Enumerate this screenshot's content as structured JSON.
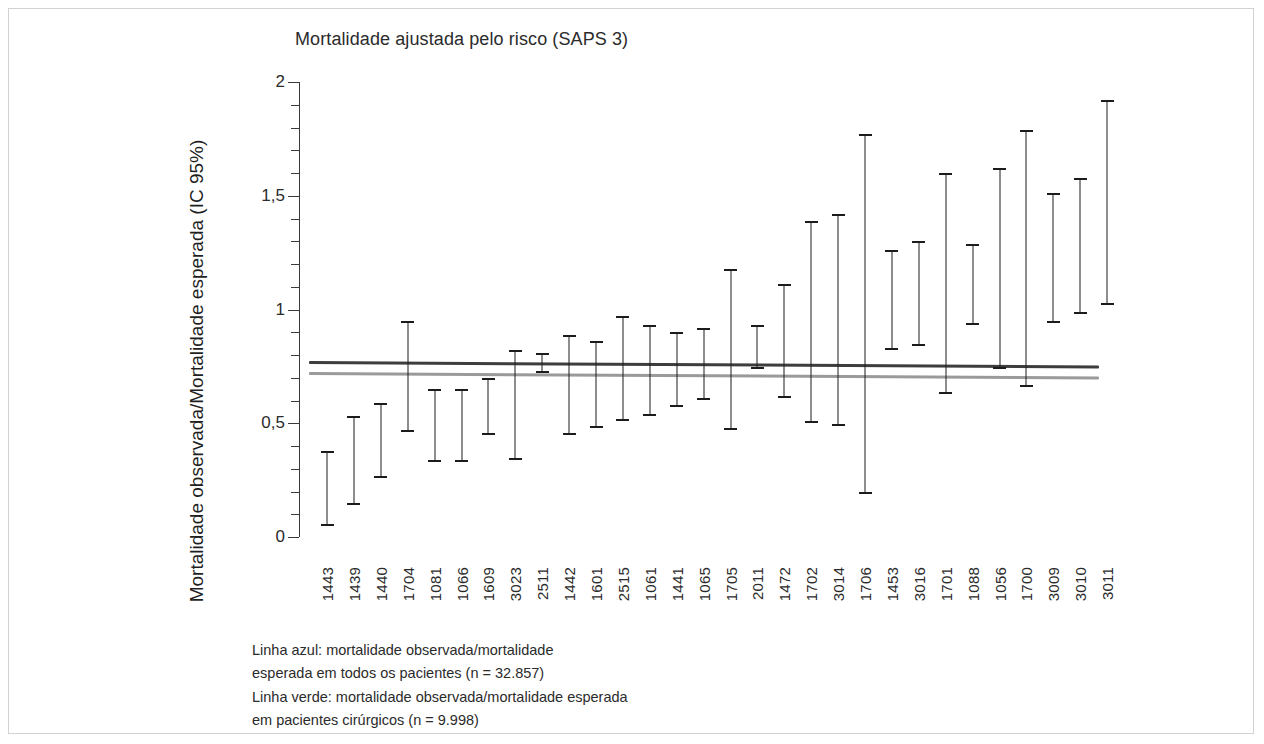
{
  "figure": {
    "title": "Mortalidade ajustada pelo risco (SAPS 3)",
    "legend_note": "Linha azul: mortalidade observada/mortalidade\nesperada em todos os pacientes (n = 32.857)\nLinha verde: mortalidade observada/mortalidade esperada\nem pacientes cirúrgicos (n = 9.998)"
  },
  "chart_data": {
    "type": "errorbar",
    "title": "Mortalidade ajustada pelo risco (SAPS 3)",
    "xlabel": "",
    "ylabel": "Mortalidade observada/Mortalidade esperada (IC 95%)",
    "ylim": [
      0,
      2
    ],
    "ytick_labels": [
      "0",
      "0,5",
      "1",
      "1,5",
      "2"
    ],
    "ytick_values": [
      0,
      0.5,
      1,
      1.5,
      2
    ],
    "minor_tick_step": 0.1,
    "grid": false,
    "legend_position": "below-axes",
    "categories": [
      "1443",
      "1439",
      "1440",
      "1704",
      "1081",
      "1066",
      "1609",
      "3023",
      "2511",
      "1442",
      "1601",
      "2515",
      "1061",
      "1441",
      "1065",
      "1705",
      "2011",
      "1472",
      "1702",
      "3014",
      "1706",
      "1453",
      "3016",
      "1701",
      "1088",
      "1056",
      "1700",
      "3009",
      "3010",
      "3011"
    ],
    "ci_low": [
      0.05,
      0.14,
      0.26,
      0.46,
      0.33,
      0.33,
      0.45,
      0.34,
      0.72,
      0.45,
      0.48,
      0.51,
      0.53,
      0.57,
      0.6,
      0.47,
      0.74,
      0.61,
      0.5,
      0.49,
      0.19,
      0.82,
      0.84,
      0.63,
      0.93,
      0.74,
      0.66,
      0.94,
      0.98,
      1.02
    ],
    "ci_high": [
      0.38,
      0.53,
      0.59,
      0.95,
      0.65,
      0.65,
      0.7,
      0.82,
      0.81,
      0.89,
      0.86,
      0.97,
      0.93,
      0.9,
      0.92,
      1.18,
      0.93,
      1.11,
      1.39,
      1.42,
      1.77,
      1.26,
      1.3,
      1.6,
      1.29,
      1.62,
      1.79,
      1.51,
      1.58,
      1.92
    ],
    "reference_lines": [
      {
        "name": "Linha azul",
        "label": "mortalidade observada/mortalidade esperada em todos os pacientes (n = 32.857)",
        "value_left": 0.775,
        "value_right": 0.755,
        "color": "#3d3d3d",
        "n": 32857
      },
      {
        "name": "Linha verde",
        "label": "mortalidade observada/mortalidade esperada em pacientes cirúrgicos (n = 9.998)",
        "value_left": 0.725,
        "value_right": 0.705,
        "color": "#9a9a9a",
        "n": 9998
      }
    ]
  }
}
